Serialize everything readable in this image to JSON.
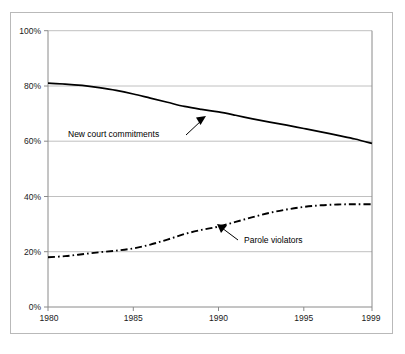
{
  "chart_data": {
    "type": "line",
    "title": "",
    "subtitle": "",
    "xlabel": "",
    "ylabel": "",
    "xlim": [
      1980,
      1999
    ],
    "ylim": [
      0,
      100
    ],
    "grid": true,
    "legend_position": "inline-annotations",
    "x_tick_labels": [
      "1980",
      "1985",
      "1990",
      "1995",
      "1999"
    ],
    "x_ticks": [
      1980,
      1985,
      1990,
      1995,
      1999
    ],
    "y_tick_labels": [
      "0%",
      "20%",
      "40%",
      "60%",
      "80%",
      "100%"
    ],
    "y_ticks": [
      0,
      20,
      40,
      60,
      80,
      100
    ],
    "x": [
      1980,
      1981,
      1982,
      1983,
      1984,
      1985,
      1986,
      1987,
      1988,
      1989,
      1990,
      1991,
      1992,
      1993,
      1994,
      1995,
      1996,
      1997,
      1998,
      1999
    ],
    "series": [
      {
        "name": "New court commitments",
        "style": "solid",
        "color": "#000000",
        "values": [
          81,
          80.7,
          80.2,
          79.4,
          78.4,
          77.1,
          75.6,
          74.1,
          72.6,
          71.5,
          70.6,
          69.4,
          68.1,
          66.9,
          65.8,
          64.6,
          63.4,
          62.1,
          60.8,
          59.2
        ]
      },
      {
        "name": "Parole violators",
        "style": "dash-dot",
        "color": "#000000",
        "values": [
          18,
          18.4,
          19.1,
          19.8,
          20.4,
          21.2,
          22.6,
          24.4,
          26.4,
          27.9,
          29.1,
          30.8,
          32.5,
          34.1,
          35.3,
          36.2,
          36.8,
          37.1,
          37.2,
          37.2
        ]
      }
    ],
    "annotations": [
      {
        "label": "New court commitments",
        "points_to_series": "New court commitments",
        "arrow_direction": "up-right"
      },
      {
        "label": "Parole violators",
        "points_to_series": "Parole violators",
        "arrow_direction": "up-left"
      }
    ]
  }
}
